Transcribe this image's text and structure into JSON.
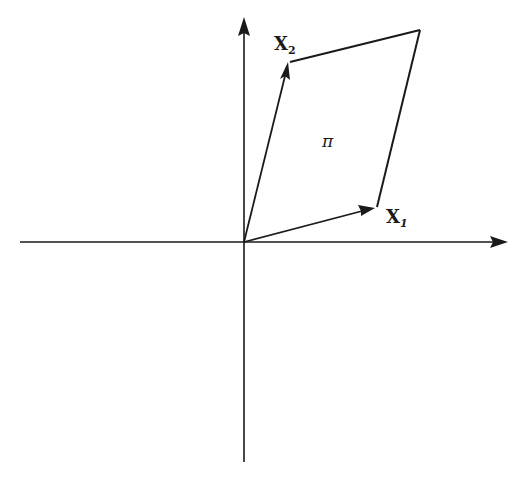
{
  "figure": {
    "axes": {
      "horizontal": "x-axis",
      "vertical": "y-axis"
    },
    "vectors": [
      {
        "id": "x1",
        "label_main": "X",
        "label_sub": "1"
      },
      {
        "id": "x2",
        "label_main": "X",
        "label_sub": "2"
      }
    ],
    "region_label": "π"
  }
}
